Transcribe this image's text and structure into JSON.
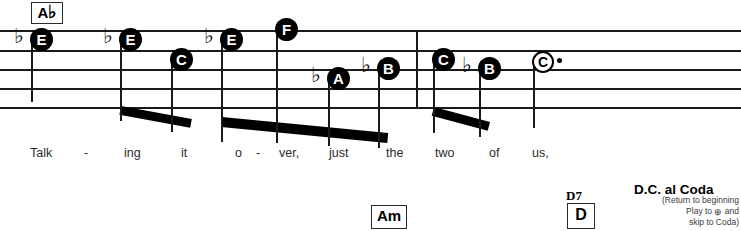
{
  "sheet": {
    "title": "Easy-play notation excerpt",
    "staff": {
      "line_count": 5,
      "line_y": [
        30,
        50,
        69,
        88,
        107
      ],
      "left": 0,
      "right": 741,
      "barline_x": [
        416
      ],
      "ink_color": "#1a1a1a"
    },
    "chords": [
      {
        "name": "chord-ab",
        "label": "A",
        "accidental": "♭",
        "x": 31,
        "y": 2,
        "w": 30,
        "h": 20,
        "font_size": 15
      },
      {
        "name": "chord-am",
        "label": "Am",
        "accidental": "",
        "x": 371,
        "y": 205,
        "w": 34,
        "h": 22,
        "font_size": 15
      },
      {
        "name": "chord-d",
        "label": "D",
        "accidental": "",
        "x": 567,
        "y": 203,
        "w": 26,
        "h": 24,
        "font_size": 16
      }
    ],
    "chord_labels_above": [
      {
        "name": "chord-symbol-d7",
        "text": "D7",
        "x": 566,
        "y": 188
      }
    ],
    "notes": [
      {
        "name": "note-e-flat-1",
        "letter": "E",
        "accidental": "♭",
        "head_x": 30,
        "head_y": 28,
        "hollow": false,
        "stem": "down",
        "stem_h": 62,
        "flat_dx": -16,
        "flat_dy": -2
      },
      {
        "name": "note-e-flat-2",
        "letter": "E",
        "accidental": "♭",
        "head_x": 119,
        "head_y": 28,
        "hollow": false,
        "stem": "down",
        "stem_h": 81,
        "flat_dx": -16,
        "flat_dy": -2
      },
      {
        "name": "note-c-1",
        "letter": "C",
        "accidental": "",
        "head_x": 170,
        "head_y": 48,
        "hollow": false,
        "stem": "down",
        "stem_h": 72,
        "flat_dx": 0,
        "flat_dy": 0
      },
      {
        "name": "note-e-flat-3",
        "letter": "E",
        "accidental": "♭",
        "head_x": 220,
        "head_y": 28,
        "hollow": false,
        "stem": "down",
        "stem_h": 102,
        "flat_dx": -16,
        "flat_dy": -2
      },
      {
        "name": "note-f-1",
        "letter": "F",
        "accidental": "",
        "head_x": 275,
        "head_y": 18,
        "hollow": false,
        "stem": "down",
        "stem_h": 113,
        "flat_dx": 0,
        "flat_dy": 0
      },
      {
        "name": "note-a-flat-1",
        "letter": "A",
        "accidental": "♭",
        "head_x": 327,
        "head_y": 67,
        "hollow": false,
        "stem": "down",
        "stem_h": 67,
        "flat_dx": -16,
        "flat_dy": -2
      },
      {
        "name": "note-b-flat-1",
        "letter": "B",
        "accidental": "♭",
        "head_x": 377,
        "head_y": 57,
        "hollow": false,
        "stem": "down",
        "stem_h": 79,
        "flat_dx": -16,
        "flat_dy": -2
      },
      {
        "name": "note-c-2",
        "letter": "C",
        "accidental": "",
        "head_x": 432,
        "head_y": 48,
        "hollow": false,
        "stem": "down",
        "stem_h": 73,
        "flat_dx": 0,
        "flat_dy": 0
      },
      {
        "name": "note-b-flat-2",
        "letter": "B",
        "accidental": "♭",
        "head_x": 478,
        "head_y": 57,
        "hollow": false,
        "stem": "down",
        "stem_h": 68,
        "flat_dx": -16,
        "flat_dy": -2
      },
      {
        "name": "note-c-half-dotted",
        "letter": "C",
        "accidental": "",
        "head_x": 532,
        "head_y": 51,
        "hollow": true,
        "stem": "down",
        "stem_h": 68,
        "flat_dx": 0,
        "flat_dy": 0,
        "dotted": true
      }
    ],
    "beams": [
      {
        "name": "beam-group-1",
        "x1": 121,
        "y1": 106,
        "x2": 192,
        "y2": 119,
        "thickness": 9
      },
      {
        "name": "beam-group-2",
        "x1": 222,
        "y1": 117,
        "x2": 388,
        "y2": 133,
        "thickness": 10
      },
      {
        "name": "beam-group-3",
        "x1": 434,
        "y1": 107,
        "x2": 490,
        "y2": 122,
        "thickness": 9
      }
    ],
    "lyrics": [
      {
        "name": "lyric-syllable",
        "text": "Talk",
        "x": 30
      },
      {
        "name": "lyric-hyphen",
        "text": "-",
        "x": 84
      },
      {
        "name": "lyric-syllable",
        "text": "ing",
        "x": 124
      },
      {
        "name": "lyric-syllable",
        "text": "it",
        "x": 181
      },
      {
        "name": "lyric-syllable",
        "text": "o",
        "x": 235
      },
      {
        "name": "lyric-hyphen",
        "text": "-",
        "x": 256
      },
      {
        "name": "lyric-syllable",
        "text": "ver,",
        "x": 279
      },
      {
        "name": "lyric-syllable",
        "text": "just",
        "x": 329
      },
      {
        "name": "lyric-syllable",
        "text": "the",
        "x": 386
      },
      {
        "name": "lyric-syllable",
        "text": "two",
        "x": 435
      },
      {
        "name": "lyric-syllable",
        "text": "of",
        "x": 489
      },
      {
        "name": "lyric-syllable",
        "text": "us,",
        "x": 532
      }
    ],
    "directions": {
      "title": "D.C. al Coda",
      "title_x": 634,
      "title_y": 182,
      "note_x": 634,
      "note_y": 195,
      "note_lines": [
        {
          "before": "(Return to beginning",
          "glyph": "",
          "after": ""
        },
        {
          "before": "Play to ",
          "glyph": "⊕",
          "after": " and"
        },
        {
          "before": "skip to Coda)",
          "glyph": "",
          "after": ""
        }
      ]
    }
  }
}
